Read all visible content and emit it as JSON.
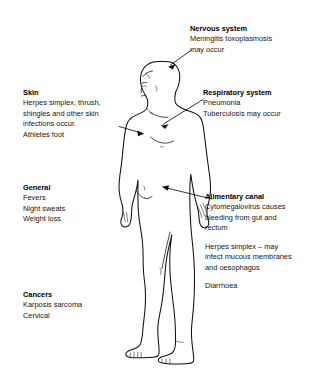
{
  "diagram": {
    "figure_label": "human-body-outline",
    "background_color": "#ffffff",
    "text_color": "#141414",
    "outline_color": "#101010"
  },
  "labels": {
    "nervous": {
      "heading": "Nervous system",
      "lines": [
        "Meningitis toxoplasmosis",
        "may occur"
      ]
    },
    "skin": {
      "heading": "Skin",
      "lines": [
        "Herpes simplex, thrush,",
        "shingles and other skin",
        "infections occur.",
        "Athletes foot"
      ]
    },
    "respiratory": {
      "heading": "Respiratory system",
      "lines": [
        "Pneumonia",
        "Tuberculosis may occur"
      ]
    },
    "general": {
      "heading": "General",
      "lines": [
        "Fevers",
        "Night sweats",
        "Weight loss"
      ]
    },
    "alimentary": {
      "heading": "Alimentary canal",
      "para1": [
        "Cytomegalovirus causes",
        "bleeding from gut and",
        "rectum"
      ],
      "para2": [
        "Herpes simplex – may",
        "infect mucous membranes",
        "and oesophagus"
      ],
      "para3": [
        "Diarrhoea"
      ]
    },
    "cancers": {
      "heading": "Cancers",
      "lines": [
        "Karposis sarcoma",
        "Cervical"
      ]
    }
  },
  "pointers": [
    {
      "name": "nervous-pointer",
      "target": "head"
    },
    {
      "name": "skin-pointer",
      "target": "left-shoulder"
    },
    {
      "name": "respiratory-pointer",
      "target": "chest"
    },
    {
      "name": "alimentary-pointer",
      "target": "lower-abdomen"
    }
  ]
}
